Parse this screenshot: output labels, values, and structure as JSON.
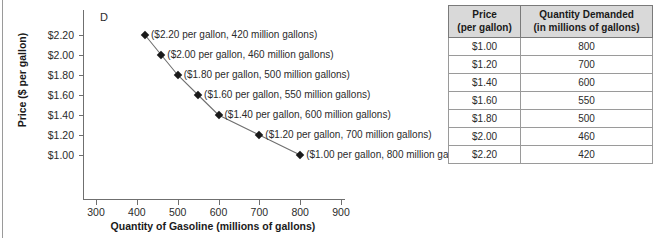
{
  "figure": {
    "curve_label": "D"
  },
  "chart_data": {
    "type": "line",
    "title": "",
    "xlabel": "Quantity of Gasoline (millions of gallons)",
    "ylabel": "Price ($ per gallon)",
    "xlim": [
      300,
      900
    ],
    "ylim": [
      0.9,
      2.3
    ],
    "grid": false,
    "legend": "none",
    "series_name": "D",
    "x": [
      420,
      460,
      500,
      550,
      600,
      700,
      800
    ],
    "y": [
      2.2,
      2.0,
      1.8,
      1.6,
      1.4,
      1.2,
      1.0
    ],
    "x_ticks": [
      "300",
      "400",
      "500",
      "600",
      "700",
      "800",
      "900"
    ],
    "x_tick_values": [
      300,
      400,
      500,
      600,
      700,
      800,
      900
    ],
    "y_ticks": [
      "$1.00",
      "$1.20",
      "$1.40",
      "$1.60",
      "$1.80",
      "$2.00",
      "$2.20"
    ],
    "y_tick_values": [
      1.0,
      1.2,
      1.4,
      1.6,
      1.8,
      2.0,
      2.2
    ],
    "annotations": [
      "($2.20 per gallon, 420 million gallons)",
      "($2.00 per gallon, 460 million gallons)",
      "($1.80 per gallon, 500 million gallons)",
      "($1.60 per gallon, 550 million gallons)",
      "($1.40 per gallon, 600 million gallons)",
      "($1.20 per gallon, 700 million gallons)",
      "($1.00 per gallon, 800 million gallons)"
    ]
  },
  "table": {
    "headers": [
      "Price\n(per gallon)",
      "Quantity Demanded\n(in millions of gallons)"
    ],
    "header_price_line1": "Price",
    "header_price_line2": "(per gallon)",
    "header_qty_line1": "Quantity Demanded",
    "header_qty_line2": "(in millions of gallons)",
    "rows": [
      {
        "price": "$1.00",
        "quantity": "800"
      },
      {
        "price": "$1.20",
        "quantity": "700"
      },
      {
        "price": "$1.40",
        "quantity": "600"
      },
      {
        "price": "$1.60",
        "quantity": "550"
      },
      {
        "price": "$1.80",
        "quantity": "500"
      },
      {
        "price": "$2.00",
        "quantity": "460"
      },
      {
        "price": "$2.20",
        "quantity": "420"
      }
    ]
  },
  "colors": {
    "header_bg": "#d9d9d9",
    "border": "#7a7a7a",
    "axis": "#6f6f6f",
    "marker": "#1a1a1a",
    "curve": "#6f6f6f",
    "text": "#2b2b2b"
  }
}
